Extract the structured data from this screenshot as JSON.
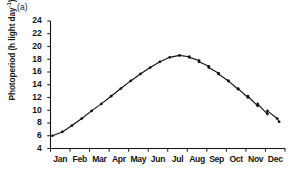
{
  "panel": {
    "label": "(a)"
  },
  "chart_data": {
    "type": "line",
    "title": "",
    "subtitle": "",
    "panel_label": "(a)",
    "xlabel": "",
    "ylabel": "Photoperiod (h light day-1)",
    "ylabel_text": "Photoperiod (h light day",
    "ylabel_sup": "-1",
    "ylabel_close": ")",
    "ylim": [
      4,
      24
    ],
    "yticks": [
      4,
      6,
      8,
      10,
      12,
      14,
      16,
      18,
      20,
      22,
      24
    ],
    "ytick_labels": [
      "4",
      "6",
      "8",
      "10",
      "12",
      "14",
      "16",
      "18",
      "20",
      "22",
      "24"
    ],
    "xlim": [
      0,
      12
    ],
    "categories": [
      "Jan",
      "Feb",
      "Mar",
      "Apr",
      "May",
      "Jun",
      "Jul",
      "Aug",
      "Sep",
      "Oct",
      "Nov",
      "Dec"
    ],
    "xtick_labels": [
      "Jan",
      "Feb",
      "Mar",
      "Apr",
      "May",
      "Jun",
      "Jul",
      "Aug",
      "Sep",
      "Oct",
      "Nov",
      "Dec"
    ],
    "grid": false,
    "legend": null,
    "legend_position": "none",
    "marker": "filled-circle",
    "line_color": "#111111",
    "marker_color": "#111111",
    "series": [
      {
        "name": "Photoperiod",
        "x": [
          0.1,
          0.6,
          1.1,
          1.6,
          2.1,
          2.6,
          3.1,
          3.6,
          4.1,
          4.6,
          5.1,
          5.6,
          6.1,
          6.6,
          7.1,
          7.6,
          8.1,
          8.6,
          9.1,
          9.6,
          10.1,
          10.6,
          11.1,
          11.7
        ],
        "values": [
          6.0,
          6.6,
          7.6,
          8.7,
          9.9,
          11.0,
          12.2,
          13.4,
          14.6,
          15.7,
          16.7,
          17.6,
          18.3,
          18.6,
          18.4,
          17.8,
          16.9,
          15.8,
          14.6,
          13.3,
          12.0,
          10.7,
          9.4,
          8.2
        ],
        "x_descending_tail": [],
        "units": "h light day-1"
      }
    ],
    "annotations": [],
    "axis_spines": [
      "left",
      "bottom"
    ],
    "tick_direction": "out"
  }
}
